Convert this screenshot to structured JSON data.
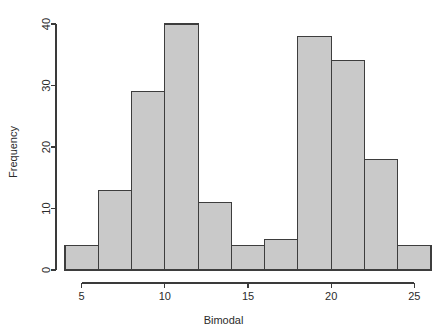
{
  "chart_data": {
    "type": "bar",
    "title": "",
    "xlabel": "Bimodal",
    "ylabel": "Frequency",
    "categories": [
      "4-6",
      "6-8",
      "8-10",
      "10-12",
      "12-14",
      "14-16",
      "16-18",
      "18-20",
      "20-22",
      "22-24",
      "24-26"
    ],
    "bin_edges": [
      4,
      6,
      8,
      10,
      12,
      14,
      16,
      18,
      20,
      22,
      24,
      26
    ],
    "bin_width": 2,
    "values": [
      4,
      13,
      29,
      40,
      11,
      4,
      5,
      38,
      34,
      18,
      4
    ],
    "xlim": [
      4,
      26
    ],
    "ylim": [
      0,
      40
    ],
    "x_ticks": [
      5,
      10,
      15,
      20,
      25
    ],
    "x_tick_labels": [
      "5",
      "10",
      "15",
      "20",
      "25"
    ],
    "y_ticks": [
      0,
      10,
      20,
      30,
      40
    ],
    "y_tick_labels": [
      "0",
      "10",
      "20",
      "30",
      "40"
    ],
    "grid": false,
    "legend": false,
    "bar_fill": "#c9c9c9",
    "bar_stroke": "#3d3d3d",
    "axis_color": "#3a3a3a",
    "background": "#ffffff"
  },
  "labels": {
    "x_axis_title": "Bimodal",
    "y_axis_title": "Frequency"
  }
}
